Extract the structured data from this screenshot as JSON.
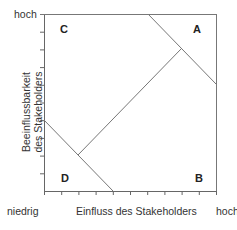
{
  "diagram": {
    "type": "stakeholder-matrix",
    "y_axis": {
      "label_line1": "Beeinflussbarkeit",
      "label_line2": "des Stakeholders",
      "high_label": "hoch"
    },
    "x_axis": {
      "label": "Einfluss des Stakeholders",
      "low_label": "niedrig",
      "high_label": "hoch"
    },
    "quadrants": {
      "top_left": "C",
      "top_right": "A",
      "bottom_left": "D",
      "bottom_right": "B"
    },
    "colors": {
      "axis": "#666666",
      "line": "#777777",
      "text": "#333333"
    }
  }
}
